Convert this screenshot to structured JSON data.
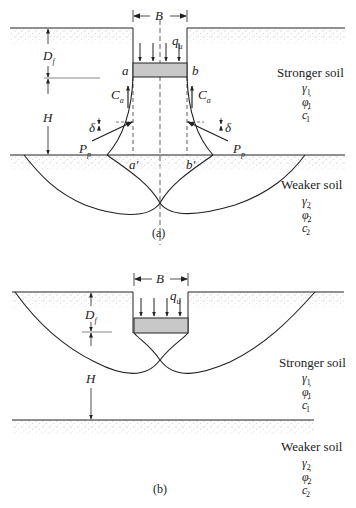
{
  "figure_a": {
    "caption": "(a)",
    "width_label": "B",
    "load_label": "q",
    "load_sub": "u",
    "depth_label": "D",
    "depth_sub": "f",
    "thickness_label": "H",
    "corner_left": "a",
    "corner_right": "b",
    "base_left": "a'",
    "base_right": "b'",
    "adhesion_label": "C",
    "adhesion_sub": "a",
    "passive_label": "P",
    "passive_sub": "p",
    "friction_angle": "δ",
    "upper_soil": {
      "name": "Stronger soil",
      "params": [
        {
          "sym": "γ",
          "sub": "1",
          "prime": ""
        },
        {
          "sym": "φ",
          "sub": "1",
          "prime": "′"
        },
        {
          "sym": "c",
          "sub": "1",
          "prime": "′"
        }
      ]
    },
    "lower_soil": {
      "name": "Weaker soil",
      "params": [
        {
          "sym": "γ",
          "sub": "2",
          "prime": ""
        },
        {
          "sym": "φ",
          "sub": "2",
          "prime": "′"
        },
        {
          "sym": "c",
          "sub": "2",
          "prime": "′"
        }
      ]
    }
  },
  "figure_b": {
    "caption": "(b)",
    "width_label": "B",
    "load_label": "q",
    "load_sub": "u",
    "depth_label": "D",
    "depth_sub": "f",
    "thickness_label": "H",
    "upper_soil": {
      "name": "Stronger soil",
      "params": [
        {
          "sym": "γ",
          "sub": "1",
          "prime": ""
        },
        {
          "sym": "φ",
          "sub": "1",
          "prime": "′"
        },
        {
          "sym": "c",
          "sub": "1",
          "prime": "′"
        }
      ]
    },
    "lower_soil": {
      "name": "Weaker soil",
      "params": [
        {
          "sym": "γ",
          "sub": "2",
          "prime": ""
        },
        {
          "sym": "φ",
          "sub": "2",
          "prime": "′"
        },
        {
          "sym": "c",
          "sub": "2",
          "prime": "′"
        }
      ]
    }
  },
  "colors": {
    "line": "#222222",
    "footing_fill": "#c8c8c8",
    "stipple": "#555555"
  }
}
